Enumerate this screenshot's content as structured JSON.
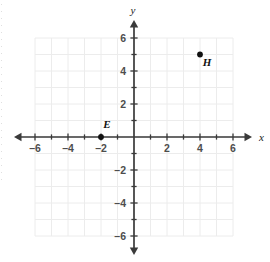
{
  "chart_data": {
    "type": "scatter",
    "title": "",
    "xlabel": "x",
    "ylabel": "y",
    "xlim": [
      -6,
      6
    ],
    "ylim": [
      -6,
      6
    ],
    "grid": true,
    "legend": "none",
    "x_tick_labels": [
      "–6",
      "–4",
      "–2",
      "2",
      "4",
      "6"
    ],
    "x_tick_values": [
      -6,
      -4,
      -2,
      2,
      4,
      6
    ],
    "y_tick_labels": [
      "6",
      "4",
      "2",
      "–2",
      "–4",
      "–6"
    ],
    "y_tick_values": [
      6,
      4,
      2,
      -2,
      -4,
      -6
    ],
    "minor_tick_step": 1,
    "points": [
      {
        "label": "E",
        "x": -2,
        "y": 0,
        "label_dx": 6,
        "label_dy": -9
      },
      {
        "label": "H",
        "x": 4,
        "y": 5,
        "label_dx": 7,
        "label_dy": 11
      }
    ]
  },
  "axes": {
    "x_axis_label": "x",
    "y_axis_label": "y",
    "axis_color": "#3a3a3a",
    "grid_color": "#ececec",
    "point_color": "#111111",
    "tick_label_color": "#4d4d4d"
  },
  "geometry": {
    "origin_x": 134,
    "origin_y": 137,
    "unit_px": 16.5,
    "grid_min": -6,
    "grid_max": 6,
    "x_arrow_left": 14,
    "x_arrow_right": 252,
    "y_arrow_top": 20,
    "y_arrow_bottom": 255
  }
}
